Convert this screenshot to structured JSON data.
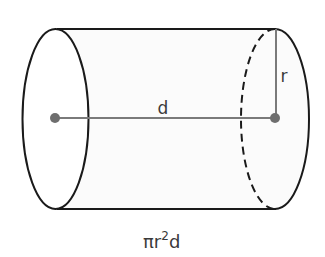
{
  "diagram": {
    "labels": {
      "length": "d",
      "radius": "r",
      "formula_pi_r": "πr",
      "formula_exp": "2",
      "formula_d": "d"
    },
    "colors": {
      "outline": "#1a1a1a",
      "axis": "#7a7a7a",
      "dot": "#6e6e6e",
      "body_fill": "#fbfbfb",
      "text": "#3a3a3a"
    }
  }
}
